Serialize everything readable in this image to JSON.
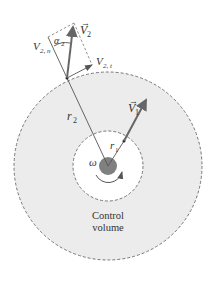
{
  "diagram": {
    "labels": {
      "v2": "V",
      "v2_sub": "2",
      "v2n": "V",
      "v2n_sub": "2, n",
      "v2t": "V",
      "v2t_sub": "2, t",
      "alpha2": "α",
      "alpha2_sub": "2",
      "r2": "r",
      "r2_sub": "2",
      "v1": "V",
      "v1_sub": "1",
      "r1": "r",
      "r1_sub": "1",
      "omega": "ω",
      "control_volume_line1": "Control",
      "control_volume_line2": "volume"
    },
    "colors": {
      "control_volume_fill": "#ececec",
      "dashed_line": "#777777",
      "hub": "#808080",
      "arrow": "#666666",
      "line": "#555555"
    }
  }
}
